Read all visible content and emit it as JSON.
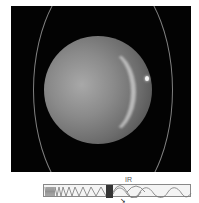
{
  "image": {
    "subject": "planet-with-rings-infrared",
    "background_color": "#030303"
  },
  "spectrum": {
    "label": "IR",
    "highlight_band_color": "#333333",
    "arrow_glyph": "➘"
  }
}
